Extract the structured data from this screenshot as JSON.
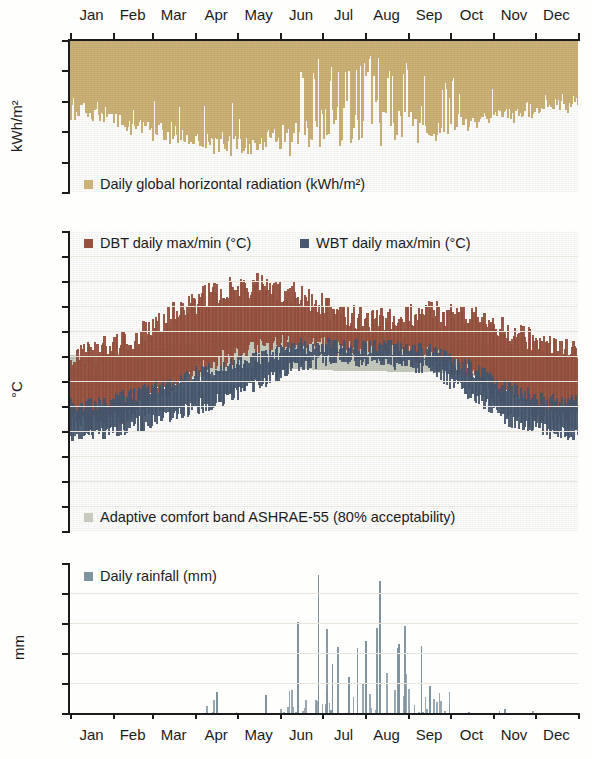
{
  "figure": {
    "months": [
      "Jan",
      "Feb",
      "Mar",
      "Apr",
      "May",
      "Jun",
      "Jul",
      "Aug",
      "Sep",
      "Oct",
      "Nov",
      "Dec"
    ]
  },
  "panels": {
    "radiation": {
      "ylabel": "kWh/m²",
      "yticks": [
        "0",
        "2",
        "4",
        "6",
        "8",
        "10"
      ],
      "legend": {
        "label": "Daily global horizontal radiation (kWh/m²)",
        "color": "#cdb277"
      }
    },
    "temperature": {
      "ylabel": "°C",
      "yticks": [
        "50",
        "45",
        "40",
        "35",
        "30",
        "25",
        "20",
        "15",
        "10",
        "5",
        "0",
        "-5",
        "-10"
      ],
      "legend_dbt": {
        "label": "DBT daily max/min (°C)",
        "color": "#96503c"
      },
      "legend_wbt": {
        "label": "WBT daily max/min (°C)",
        "color": "#46576e"
      },
      "legend_comfort": {
        "label": "Adaptive comfort band ASHRAE-55 (80% acceptability)",
        "color": "#c6cbbe"
      }
    },
    "rainfall": {
      "ylabel": "mm",
      "yticks": [
        "100",
        "80",
        "60",
        "40",
        "20",
        "0"
      ],
      "legend": {
        "label": "Daily rainfall (mm)",
        "color": "#7e93a0"
      }
    }
  },
  "chart_data": [
    {
      "type": "area",
      "id": "daily-global-horizontal-radiation",
      "title": "Daily global horizontal radiation (kWh/m²)",
      "xlabel": "",
      "ylabel": "kWh/m²",
      "ylim": [
        10,
        0
      ],
      "y_axis_inverted": true,
      "ytick_values": [
        0,
        2,
        4,
        6,
        8,
        10
      ],
      "x": "day of year (1-365), month ticks",
      "color": "#cdb277",
      "note": "Area hangs downward from 0 at top; value = daily total radiation. Monsoon (Jun-Sep) shows deep white gaps where cloud cover cuts radiation to 1-3 kWh/m².",
      "monthly_mean_values": [
        4.3,
        5.2,
        6.0,
        6.6,
        6.8,
        5.4,
        4.3,
        4.4,
        5.0,
        5.2,
        4.5,
        4.1
      ],
      "monthly_max_values": [
        5.3,
        6.2,
        6.9,
        7.6,
        7.9,
        7.3,
        6.9,
        6.9,
        6.6,
        6.1,
        5.3,
        5.0
      ],
      "monthly_min_values": [
        3.2,
        3.6,
        3.8,
        4.0,
        3.8,
        1.3,
        0.9,
        1.2,
        1.5,
        3.2,
        3.4,
        3.2
      ]
    },
    {
      "type": "area",
      "id": "dbt-wbt-daily-max-min",
      "title": "DBT / WBT daily max/min (°C) with adaptive comfort band",
      "xlabel": "",
      "ylabel": "°C",
      "ylim": [
        -10,
        50
      ],
      "ytick_values": [
        -10,
        -5,
        0,
        5,
        10,
        15,
        20,
        25,
        30,
        35,
        40,
        45,
        50
      ],
      "series": [
        {
          "name": "DBT daily max (°C)",
          "color": "#96503c",
          "monthly_values": [
            25.5,
            28.5,
            33.5,
            38.0,
            39.5,
            37.0,
            33.0,
            32.0,
            33.5,
            33.0,
            29.5,
            26.0
          ]
        },
        {
          "name": "DBT daily min (°C)",
          "color": "#96503c",
          "monthly_values": [
            11.5,
            14.0,
            19.0,
            24.0,
            27.0,
            27.5,
            26.5,
            26.0,
            25.0,
            21.0,
            15.5,
            12.0
          ]
        },
        {
          "name": "WBT daily max (°C)",
          "color": "#46576e",
          "monthly_values": [
            15.5,
            17.0,
            20.0,
            22.5,
            25.0,
            27.0,
            27.0,
            26.5,
            26.0,
            22.5,
            18.0,
            15.5
          ]
        },
        {
          "name": "WBT daily min (°C)",
          "color": "#46576e",
          "monthly_values": [
            9.5,
            11.0,
            13.5,
            16.0,
            19.5,
            23.5,
            24.5,
            24.0,
            22.5,
            17.0,
            11.5,
            9.5
          ]
        },
        {
          "name": "Adaptive comfort band ASHRAE-55 (80% acceptability)",
          "color": "#c6cbbe",
          "monthly_upper": [
            25.2,
            25.8,
            27.0,
            28.4,
            29.2,
            29.4,
            29.0,
            28.9,
            28.8,
            28.0,
            26.4,
            25.2
          ],
          "monthly_lower": [
            18.2,
            18.8,
            20.0,
            21.4,
            22.2,
            22.4,
            22.0,
            21.9,
            21.8,
            21.0,
            19.4,
            18.2
          ]
        }
      ],
      "peak_dbt_max": 43.0,
      "lowest_wbt_min": 6.0
    },
    {
      "type": "bar",
      "id": "daily-rainfall",
      "title": "Daily rainfall (mm)",
      "xlabel": "",
      "ylabel": "mm",
      "ylim": [
        0,
        100
      ],
      "ytick_values": [
        0,
        20,
        40,
        60,
        80,
        100
      ],
      "color": "#7e93a0",
      "categories": [
        "Jan",
        "Feb",
        "Mar",
        "Apr",
        "May",
        "Jun",
        "Jul",
        "Aug",
        "Sep",
        "Oct",
        "Nov",
        "Dec"
      ],
      "monthly_totals": [
        0,
        0,
        0,
        14,
        0,
        78,
        215,
        290,
        95,
        2,
        4,
        0
      ],
      "notable_events": [
        {
          "month": "Apr",
          "value": 14
        },
        {
          "month": "May",
          "value": 12
        },
        {
          "month": "Jun",
          "value": 61
        },
        {
          "month": "Jun",
          "value": 92
        },
        {
          "month": "Jul",
          "value": 33
        },
        {
          "month": "Jul",
          "value": 24
        },
        {
          "month": "Jul",
          "value": 48
        },
        {
          "month": "Aug",
          "value": 88
        },
        {
          "month": "Aug",
          "value": 46
        },
        {
          "month": "Sep",
          "value": 45
        },
        {
          "month": "Sep",
          "value": 18
        },
        {
          "month": "Nov",
          "value": 3
        }
      ],
      "max_daily": 92
    }
  ]
}
